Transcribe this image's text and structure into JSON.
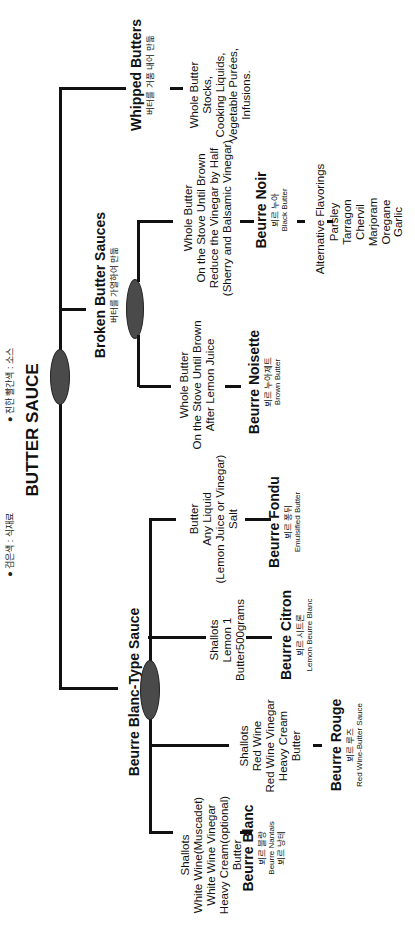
{
  "legend": {
    "items": [
      {
        "bullet": "●",
        "text": "검은색 : 식재료"
      },
      {
        "bullet": "●",
        "text": "진한 빨간색 : 소스"
      }
    ]
  },
  "root": {
    "title": "BUTTER SAUCE"
  },
  "categories": {
    "whipped": {
      "title": "Whipped  Butters",
      "kr": "버터를 거품 내어 만듦",
      "ingredients": [
        "Whole Butter",
        "Stocks,",
        "Cooking Liquids,",
        "Vegetable Purées,",
        "Infusions."
      ]
    },
    "broken": {
      "title": "Broken Butter Sauces",
      "kr": "버터를 가열하여 만듦",
      "noisette": {
        "ingredients": [
          "Whole Butter",
          "On the Stove Until Brown",
          "After Lemon Juice"
        ],
        "title": "Beurre Noisette",
        "kr": "뵈르 누아제트",
        "en": "Brown Butter"
      },
      "noir": {
        "ingredients": [
          "Whole Butter",
          "On the Stove Until Brown",
          "Reduce the Vinegar by Half",
          "(Sherry and Balsamic Vinegar)"
        ],
        "title": "Beurre Noir",
        "kr": "뵈르 누아",
        "en": "Black Butter",
        "alt_title": "Alternative Flavorings",
        "alt_items": [
          "Parsley",
          "Tarragon",
          "Chervil",
          "Marjoram",
          "Oregane",
          "Garlic"
        ]
      }
    },
    "blanc_type": {
      "title": "Beurre Blanc-Type Sauce",
      "blanc": {
        "ingredients": [
          "Shallots",
          "White Wine(Muscadet)",
          "White Wine Vinegar",
          "Heavy Cream(optional)",
          "Butter"
        ],
        "title": "Beurre Blanc",
        "kr": "뵈르 블랑",
        "en": "Beurre Nantais",
        "kr2": "뵈르 낭테"
      },
      "rouge": {
        "ingredients": [
          "Shallots",
          "Red Wine",
          "Red Wine Vinegar",
          "Heavy Cream",
          "Butter"
        ],
        "title": "Beurre Rouge",
        "kr": "뵈르 루즈",
        "en": "Red Wine-Butter Sauce"
      },
      "citron": {
        "ingredients": [
          "Shallots",
          "Lemon 1",
          "Butter500grams"
        ],
        "title": "Beurre Citron",
        "kr": "뵈르 시트론",
        "en": "Lemon Beurre Blanc"
      },
      "fondu": {
        "ingredients": [
          "Butter",
          "Any Liquid",
          "(Lemon Juice or Vinegar)",
          "Salt"
        ],
        "title": "Beurre Fondu",
        "kr": "뵈르 퐁뒤",
        "en": "Emulsified  Butter"
      }
    }
  }
}
